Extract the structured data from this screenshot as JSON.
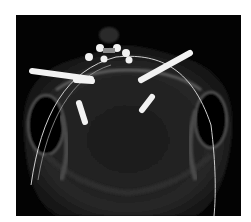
{
  "image": {
    "description": "3D CT rendering, inferior view of maxilla with dental and zygomatic implants and an arch guide wire",
    "background_color": "#030303",
    "implant_color": "#f2f2f2",
    "bone_color": "#6e6e6e",
    "implants": [
      {
        "type": "zygomatic",
        "side": "left"
      },
      {
        "type": "zygomatic",
        "side": "right"
      },
      {
        "type": "short",
        "side": "left"
      },
      {
        "type": "short",
        "side": "right"
      },
      {
        "type": "anterior-abutment",
        "count": 6
      }
    ]
  }
}
